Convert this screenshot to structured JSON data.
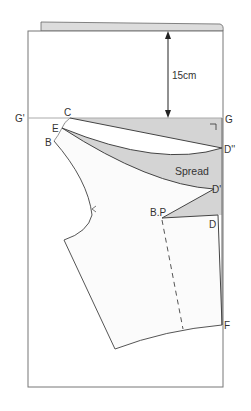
{
  "diagram": {
    "type": "pattern-draft",
    "measurement": {
      "label": "15cm"
    },
    "region_label": "Spread",
    "points": {
      "G_prime": "G'",
      "G": "G",
      "C": "C",
      "E": "E",
      "B": "B",
      "D_double_prime": "D''",
      "D_prime": "D'",
      "BP": "B.P",
      "D": "D",
      "F": "F"
    },
    "colors": {
      "line": "#555555",
      "fill_gray": "#d4d4d4",
      "paper_fold": "#dcdcdc",
      "guide": "#aaaaaa",
      "text": "#333333"
    }
  }
}
